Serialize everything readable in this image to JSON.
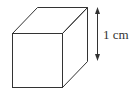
{
  "diagram": {
    "type": "cube",
    "dimension_label": "1 cm",
    "stroke_color": "#333333",
    "background": "#ffffff"
  }
}
